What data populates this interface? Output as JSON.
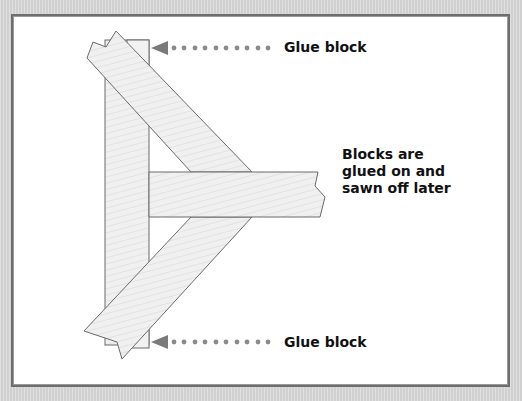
{
  "diagram": {
    "type": "woodworking-joint-illustration",
    "labels": {
      "top_glue_block": "Glue block",
      "bottom_glue_block": "Glue block",
      "note": "Blocks are\nglued on and\nsawn off later"
    },
    "colors": {
      "background": "#d8d8d8",
      "frame_border": "#6e6e6e",
      "panel": "#ffffff",
      "wood_fill": "#efefef",
      "wood_stroke": "#6a6a6a",
      "arrow": "#7a7a7a",
      "text": "#111111"
    },
    "components": [
      "vertical-member",
      "top-diagonal-brace",
      "bottom-diagonal-brace",
      "horizontal-member",
      "top-glue-block",
      "bottom-glue-block"
    ]
  }
}
